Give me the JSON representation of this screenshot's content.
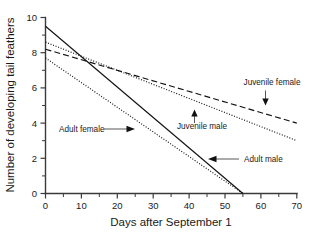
{
  "chart_data": {
    "type": "line",
    "title": "",
    "xlabel": "Days after September 1",
    "ylabel": "Number of developing tail feathers",
    "xlim": [
      0,
      70
    ],
    "ylim": [
      0,
      10
    ],
    "x_ticks": [
      0,
      10,
      20,
      30,
      40,
      50,
      60,
      70
    ],
    "x_tick_labels": [
      "0",
      "10",
      "20",
      "30",
      "40",
      "50",
      "60",
      "70"
    ],
    "x_minor_ticks": [
      5,
      15,
      25,
      35,
      45,
      55,
      65
    ],
    "y_ticks": [
      0,
      2,
      4,
      6,
      8,
      10
    ],
    "y_tick_labels": [
      "0",
      "2",
      "4",
      "6",
      "8",
      "10"
    ],
    "y_minor_ticks": [
      1,
      3,
      5,
      7,
      9
    ],
    "grid": false,
    "legend_position": "inline-annotations",
    "series": [
      {
        "name": "Adult male",
        "style": "solid",
        "x": [
          0,
          55
        ],
        "y": [
          9.5,
          0.0
        ]
      },
      {
        "name": "Adult female",
        "style": "dotted",
        "x": [
          0,
          55
        ],
        "y": [
          7.7,
          0.0
        ]
      },
      {
        "name": "Juvenile male",
        "style": "dotted",
        "x": [
          0,
          70
        ],
        "y": [
          8.6,
          3.0
        ]
      },
      {
        "name": "Juvenile female",
        "style": "dashed",
        "x": [
          0,
          70
        ],
        "y": [
          8.2,
          4.0
        ]
      }
    ],
    "annotations": [
      {
        "text": "Juvenile female",
        "series": "Juvenile female",
        "pointer": "down-arrow"
      },
      {
        "text": "Juvenile male",
        "series": "Juvenile male",
        "pointer": "up-arrow"
      },
      {
        "text": "Adult female",
        "series": "Adult female",
        "pointer": "right-arrow-with-leader"
      },
      {
        "text": "Adult male",
        "series": "Adult male",
        "pointer": "left-arrow-with-leader"
      }
    ]
  },
  "axes": {
    "x_title": "Days after September 1",
    "y_title": "Number of developing tail feathers",
    "x_tick_labels": [
      "0",
      "10",
      "20",
      "30",
      "40",
      "50",
      "60",
      "70"
    ],
    "y_tick_labels": [
      "0",
      "2",
      "4",
      "6",
      "8",
      "10"
    ]
  },
  "annotations": {
    "juvenile_female": "Juvenile female",
    "juvenile_male": "Juvenile male",
    "adult_female": "Adult female",
    "adult_male": "Adult male"
  },
  "colors": {
    "background": "#ffffff",
    "axis": "#3a3a3a",
    "line": "#111111",
    "text": "#1a1a1a"
  }
}
